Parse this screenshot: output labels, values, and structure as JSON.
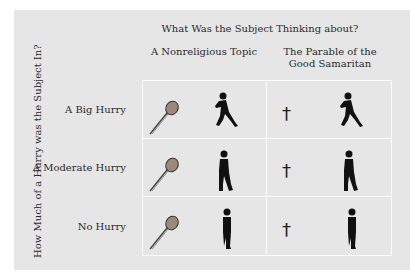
{
  "figure": {
    "title": "What Was the Subject Thinking about?",
    "columns": [
      {
        "label_line1": "A Nonreligious Topic",
        "label_line2": "",
        "icon": "microphone-icon"
      },
      {
        "label_line1": "The Parable of the",
        "label_line2": "Good Samaritan",
        "icon": "cross-icon"
      }
    ],
    "y_axis_label": "How Much of a Hurry was the Subject In?",
    "rows": [
      {
        "label": "A Big Hurry",
        "figure": "running-person-icon"
      },
      {
        "label": "A Moderate Hurry",
        "figure": "walking-person-icon"
      },
      {
        "label": "No Hurry",
        "figure": "standing-person-icon"
      }
    ],
    "cross_glyph": "†",
    "colors": {
      "panel_bg": "#e6e6e6",
      "grid_lines": "#fbfbfb",
      "ink": "#222222",
      "mic_head": "#9a8a7a"
    }
  }
}
